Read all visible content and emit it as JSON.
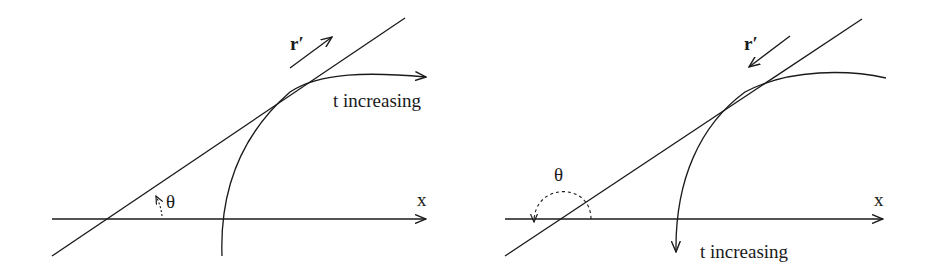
{
  "figures": [
    {
      "id": "left",
      "labels": {
        "velocity": "r′",
        "angle": "θ",
        "axis": "x",
        "direction": "t increasing"
      }
    },
    {
      "id": "right",
      "labels": {
        "velocity": "r′",
        "angle": "θ",
        "axis": "x",
        "direction": "t increasing"
      }
    }
  ],
  "colors": {
    "stroke": "#1a1a1a",
    "background": "#ffffff"
  }
}
